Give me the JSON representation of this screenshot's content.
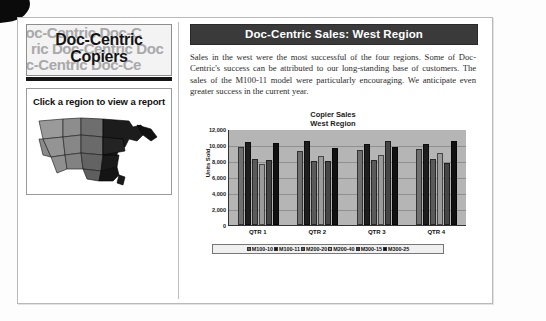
{
  "brand": {
    "title_line1": "Doc-Centric",
    "title_line2": "Copiers",
    "watermark_line1": "Doc-Centric   Doc-C",
    "watermark_line2": "ric   Doc-Centric   Doc",
    "watermark_line3": "oc-Centric  Doc-Ce"
  },
  "map": {
    "instruction": "Click a region to view a report",
    "regions": [
      {
        "name": "west",
        "fill": "#8c8c8c"
      },
      {
        "name": "central",
        "fill": "#7a7a7a"
      },
      {
        "name": "east",
        "fill": "#1c1c1c"
      }
    ]
  },
  "report": {
    "title": "Doc-Centric Sales: West Region",
    "body": "Sales in the west were the most successful of the four regions. Some of Doc-Centric's success can be attributed to our long-standing base of customers. The sales of the M100-11 model were particularly encouraging. We anticipate even greater success in the current year."
  },
  "chart_data": {
    "type": "bar",
    "title": "Copier Sales",
    "subtitle": "West Region",
    "xlabel": "",
    "ylabel": "Units Sold",
    "categories": [
      "QTR 1",
      "QTR 2",
      "QTR 3",
      "QTR 4"
    ],
    "ylim": [
      0,
      12000
    ],
    "yticks": [
      12000,
      10000,
      8000,
      6000,
      4000,
      2000,
      0
    ],
    "ytick_labels": [
      "12,000",
      "10,000",
      "8,000",
      "6,000",
      "4,000",
      "2,000",
      "0"
    ],
    "grid": true,
    "legend_position": "bottom",
    "series": [
      {
        "name": "M100-10",
        "color": "#6f6f6f",
        "values": [
          9700,
          9200,
          9300,
          9400
        ]
      },
      {
        "name": "M100-11",
        "color": "#1d1d1d",
        "values": [
          10300,
          10400,
          10100,
          10100
        ]
      },
      {
        "name": "M200-20",
        "color": "#5a5a5a",
        "values": [
          8200,
          8000,
          8100,
          8200
        ]
      },
      {
        "name": "M200-40",
        "color": "#9b9b9b",
        "values": [
          7600,
          8600,
          8700,
          8900
        ]
      },
      {
        "name": "M300-15",
        "color": "#464646",
        "values": [
          8100,
          8000,
          10400,
          7700
        ]
      },
      {
        "name": "M300-25",
        "color": "#111111",
        "values": [
          10200,
          9600,
          9700,
          10400
        ]
      }
    ]
  }
}
